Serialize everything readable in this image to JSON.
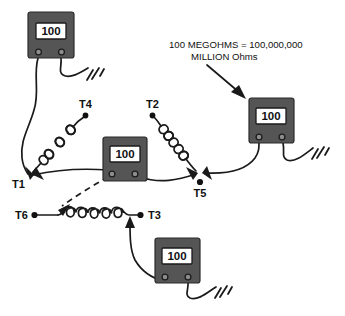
{
  "diagram": {
    "background_color": "#ffffff",
    "ink_color": "#1a1a1a",
    "meter_body_color": "#555555",
    "meter_screen_color": "#ffffff",
    "annotation": {
      "line1": "100 MEGOHMS = 100,000,000",
      "line2": "MILLION Ohms"
    },
    "meters": [
      {
        "id": "meter-top-left",
        "reading": "100"
      },
      {
        "id": "meter-center",
        "reading": "100"
      },
      {
        "id": "meter-right",
        "reading": "100"
      },
      {
        "id": "meter-bottom",
        "reading": "100"
      }
    ],
    "terminals": [
      {
        "id": "T1",
        "label": "T1"
      },
      {
        "id": "T2",
        "label": "T2"
      },
      {
        "id": "T3",
        "label": "T3"
      },
      {
        "id": "T4",
        "label": "T4"
      },
      {
        "id": "T5",
        "label": "T5"
      },
      {
        "id": "T6",
        "label": "T6"
      }
    ],
    "components": {
      "coil_t1_t4": "inductor-coil",
      "coil_t2_t5": "inductor-coil",
      "coil_t6_t3": "inductor-coil"
    },
    "grounds": [
      {
        "id": "ground-top-left"
      },
      {
        "id": "ground-right"
      },
      {
        "id": "ground-bottom"
      }
    ]
  }
}
